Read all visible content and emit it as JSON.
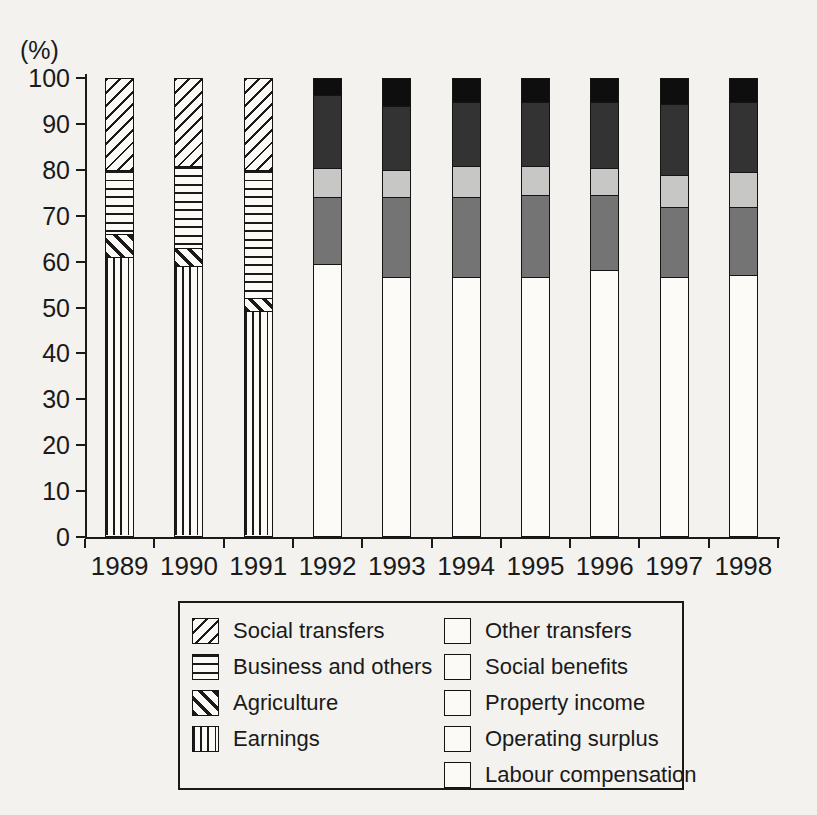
{
  "chart": {
    "percent_label": "(%)",
    "y_ticks": [
      "100",
      "90",
      "80",
      "70",
      "60",
      "50",
      "40",
      "30",
      "20",
      "10",
      "0"
    ]
  },
  "chart_data": {
    "type": "bar",
    "stacked": true,
    "title": "",
    "ylabel": "(%)",
    "ylim": [
      0,
      100
    ],
    "grid": false,
    "legend_position": "bottom",
    "categories": [
      "1989",
      "1990",
      "1991",
      "1992",
      "1993",
      "1994",
      "1995",
      "1996",
      "1997",
      "1998"
    ],
    "series": [
      {
        "name": "Earnings",
        "style": "earnings",
        "values": [
          61,
          59,
          49,
          0,
          0,
          0,
          0,
          0,
          0,
          0
        ]
      },
      {
        "name": "Agriculture",
        "style": "agriculture",
        "values": [
          5,
          4,
          3,
          0,
          0,
          0,
          0,
          0,
          0,
          0
        ]
      },
      {
        "name": "Business and others",
        "style": "business",
        "values": [
          14,
          18,
          28,
          0,
          0,
          0,
          0,
          0,
          0,
          0
        ]
      },
      {
        "name": "Social transfers",
        "style": "social_transfers",
        "values": [
          20,
          19,
          20,
          0,
          0,
          0,
          0,
          0,
          0,
          0
        ]
      },
      {
        "name": "Labour compensation",
        "style": "labour",
        "values": [
          0,
          0,
          0,
          59.5,
          56.5,
          56.5,
          56.5,
          58,
          56.5,
          57
        ]
      },
      {
        "name": "Operating surplus",
        "style": "operating",
        "values": [
          0,
          0,
          0,
          14.5,
          17.5,
          17.5,
          18,
          16.5,
          15.5,
          15
        ]
      },
      {
        "name": "Property income",
        "style": "property",
        "values": [
          0,
          0,
          0,
          6.5,
          6,
          7,
          6.5,
          6,
          7,
          7.5
        ]
      },
      {
        "name": "Social benefits",
        "style": "benefits",
        "values": [
          0,
          0,
          0,
          16,
          14,
          14,
          14,
          14.5,
          15.5,
          15.5
        ]
      },
      {
        "name": "Other transfers",
        "style": "other_transfers",
        "values": [
          0,
          0,
          0,
          3.5,
          6,
          5,
          5,
          5,
          5.5,
          5
        ]
      }
    ]
  },
  "legend": {
    "left": [
      {
        "label": "Social transfers",
        "style": "social_transfers"
      },
      {
        "label": "Business and others",
        "style": "business"
      },
      {
        "label": "Agriculture",
        "style": "agriculture"
      },
      {
        "label": "Earnings",
        "style": "earnings"
      }
    ],
    "right": [
      {
        "label": "Other transfers",
        "style": "other_transfers"
      },
      {
        "label": "Social benefits",
        "style": "benefits"
      },
      {
        "label": "Property income",
        "style": "property"
      },
      {
        "label": "Operating surplus",
        "style": "operating"
      },
      {
        "label": "Labour compensation",
        "style": "labour"
      }
    ]
  },
  "styles": {
    "social_transfers": {
      "pattern": "diagonal-up-hatch"
    },
    "business": {
      "pattern": "horizontal-lines"
    },
    "agriculture": {
      "pattern": "diagonal-down-thick-hatch"
    },
    "earnings": {
      "pattern": "vertical-lines"
    },
    "other_transfers": {
      "color": "#0e0e0e"
    },
    "benefits": {
      "color": "#333333"
    },
    "property": {
      "color": "#c7c7c5"
    },
    "operating": {
      "color": "#747474"
    },
    "labour": {
      "color": "#fcfbf8"
    }
  },
  "colors": {
    "ink": "#1a1a1a",
    "paper": "#f3f2ee"
  }
}
